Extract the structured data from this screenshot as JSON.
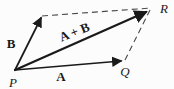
{
  "figure": {
    "background": "#fcfcfc",
    "ink_color": "#1a1a1a",
    "dash_color": "#4a4a4a",
    "vertices": {
      "origin": "P",
      "tip_a": "Q",
      "sum_corner": "R"
    },
    "vectors": {
      "a": "A",
      "b": "B",
      "sum": "A + B"
    }
  }
}
